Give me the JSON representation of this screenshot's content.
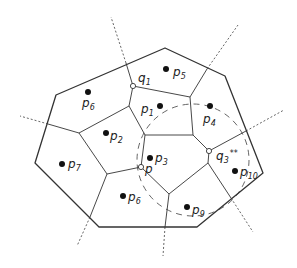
{
  "diagram": {
    "colors": {
      "edge": "#333333",
      "dashed": "#555555",
      "site": "#111111",
      "background": "#ffffff"
    },
    "sites": [
      {
        "id": "p1",
        "name": "p",
        "sub": "1",
        "x": 160,
        "y": 106,
        "lx": 141,
        "ly": 113
      },
      {
        "id": "p2",
        "name": "p",
        "sub": "2",
        "x": 106,
        "y": 133,
        "lx": 110,
        "ly": 140
      },
      {
        "id": "p3",
        "name": "p",
        "sub": "3",
        "x": 150,
        "y": 158,
        "lx": 155,
        "ly": 162
      },
      {
        "id": "p4",
        "name": "p",
        "sub": "4",
        "x": 210,
        "y": 106,
        "lx": 203,
        "ly": 123
      },
      {
        "id": "p5",
        "name": "p",
        "sub": "5",
        "x": 166,
        "y": 69,
        "lx": 173,
        "ly": 76
      },
      {
        "id": "p6",
        "name": "p",
        "sub": "6",
        "x": 88,
        "y": 92,
        "lx": 82,
        "ly": 107
      },
      {
        "id": "p7",
        "name": "p",
        "sub": "7",
        "x": 62,
        "y": 164,
        "lx": 68,
        "ly": 168
      },
      {
        "id": "p8",
        "name": "p",
        "sub": "6",
        "x": 123,
        "y": 196,
        "lx": 128,
        "ly": 201
      },
      {
        "id": "p9",
        "name": "p",
        "sub": "9",
        "x": 187,
        "y": 207,
        "lx": 192,
        "ly": 214
      },
      {
        "id": "p10",
        "name": "p",
        "sub": "10",
        "x": 235,
        "y": 171,
        "lx": 240,
        "ly": 176
      }
    ],
    "query_points": [
      {
        "id": "q1",
        "name": "q",
        "sub": "1",
        "sup": "",
        "x": 133,
        "y": 86,
        "lx": 138,
        "ly": 82
      },
      {
        "id": "q3",
        "name": "q",
        "sub": "3",
        "sup": "**",
        "x": 209,
        "y": 151,
        "lx": 216,
        "ly": 160
      },
      {
        "id": "p",
        "name": "p",
        "sub": "",
        "sup": "",
        "x": 141,
        "y": 167,
        "lx": 145,
        "ly": 173
      }
    ],
    "hull": [
      [
        56,
        95
      ],
      [
        165,
        48
      ],
      [
        225,
        76
      ],
      [
        263,
        173
      ],
      [
        197,
        227
      ],
      [
        99,
        227
      ],
      [
        35,
        163
      ]
    ],
    "edges": [
      [
        [
          133,
          86
        ],
        [
          129,
          106
        ]
      ],
      [
        [
          133,
          86
        ],
        [
          190,
          97
        ]
      ],
      [
        [
          126,
          63
        ],
        [
          133,
          86
        ]
      ],
      [
        [
          190,
          97
        ],
        [
          207,
          69
        ]
      ],
      [
        [
          190,
          97
        ],
        [
          193,
          135
        ]
      ],
      [
        [
          129,
          106
        ],
        [
          79,
          133
        ]
      ],
      [
        [
          129,
          106
        ],
        [
          145,
          135
        ]
      ],
      [
        [
          145,
          135
        ],
        [
          193,
          135
        ]
      ],
      [
        [
          193,
          135
        ],
        [
          209,
          151
        ]
      ],
      [
        [
          209,
          151
        ],
        [
          246,
          131
        ]
      ],
      [
        [
          209,
          151
        ],
        [
          208,
          163
        ]
      ],
      [
        [
          208,
          163
        ],
        [
          231,
          198
        ]
      ],
      [
        [
          208,
          163
        ],
        [
          169,
          194
        ]
      ],
      [
        [
          169,
          194
        ],
        [
          141,
          167
        ]
      ],
      [
        [
          169,
          194
        ],
        [
          165,
          227
        ]
      ],
      [
        [
          145,
          135
        ],
        [
          141,
          167
        ]
      ],
      [
        [
          141,
          167
        ],
        [
          107,
          174
        ]
      ],
      [
        [
          107,
          174
        ],
        [
          79,
          133
        ]
      ],
      [
        [
          107,
          174
        ],
        [
          90,
          217
        ]
      ],
      [
        [
          79,
          133
        ],
        [
          48,
          124
        ]
      ]
    ],
    "rays": [
      [
        [
          126,
          63
        ],
        [
          111,
          17
        ]
      ],
      [
        [
          207,
          69
        ],
        [
          238,
          25
        ]
      ],
      [
        [
          246,
          131
        ],
        [
          284,
          110
        ]
      ],
      [
        [
          231,
          198
        ],
        [
          253,
          232
        ]
      ],
      [
        [
          165,
          227
        ],
        [
          163,
          256
        ]
      ],
      [
        [
          90,
          217
        ],
        [
          77,
          246
        ]
      ],
      [
        [
          48,
          124
        ],
        [
          20,
          116
        ]
      ]
    ],
    "circle": {
      "cx": 193,
      "cy": 160,
      "r": 56
    }
  }
}
